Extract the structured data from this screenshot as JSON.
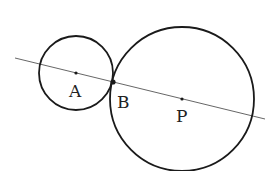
{
  "diagram": {
    "type": "geometry",
    "points": [
      {
        "label": "A",
        "x": 76,
        "y": 73
      },
      {
        "label": "B",
        "x": 113,
        "y": 82
      },
      {
        "label": "P",
        "x": 182,
        "y": 99
      }
    ],
    "circles": [
      {
        "name": "small-circle",
        "center": "A",
        "cx": 76,
        "cy": 73,
        "r": 37
      },
      {
        "name": "large-circle",
        "center": "P",
        "cx": 182,
        "cy": 99,
        "r": 72
      }
    ],
    "line": {
      "x1": 15,
      "y1": 58,
      "x2": 265,
      "y2": 119
    },
    "labels": {
      "A": "A",
      "B": "B",
      "P": "P"
    },
    "colors": {
      "stroke": "#1a1a1a",
      "line": "#555555",
      "background": "#ffffff"
    }
  }
}
